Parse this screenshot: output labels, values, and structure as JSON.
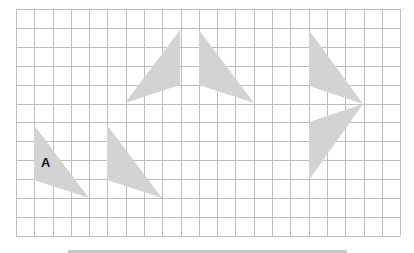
{
  "diagram": {
    "type": "grid-transformations",
    "grid": {
      "columns": 21,
      "rows": 12,
      "origin_px": [
        16,
        9
      ],
      "cell_w": 18.29,
      "cell_h": 18.9,
      "line_color": "#bdbdbd"
    },
    "shape_fill": "#d3d3d3",
    "shapes": [
      {
        "id": "A",
        "label": "A",
        "points": [
          [
            34,
            125
          ],
          [
            34,
            180
          ],
          [
            89,
            198
          ]
        ],
        "label_pos": [
          41,
          167
        ]
      },
      {
        "id": "B",
        "label": "",
        "points": [
          [
            107,
            125
          ],
          [
            107,
            180
          ],
          [
            162,
            198
          ]
        ]
      },
      {
        "id": "C",
        "label": "",
        "points": [
          [
            180,
            30
          ],
          [
            180,
            85
          ],
          [
            125,
            103
          ]
        ]
      },
      {
        "id": "D",
        "label": "",
        "points": [
          [
            199,
            30
          ],
          [
            199,
            85
          ],
          [
            254,
            103
          ]
        ]
      },
      {
        "id": "E",
        "label": "",
        "points": [
          [
            309,
            30
          ],
          [
            309,
            86
          ],
          [
            363,
            104
          ]
        ]
      },
      {
        "id": "F",
        "label": "",
        "points": [
          [
            363,
            104
          ],
          [
            309,
            122
          ],
          [
            309,
            180
          ]
        ]
      }
    ],
    "bottom_bar_color": "#c8c8c8"
  },
  "labels": {
    "shape_a": "A"
  }
}
